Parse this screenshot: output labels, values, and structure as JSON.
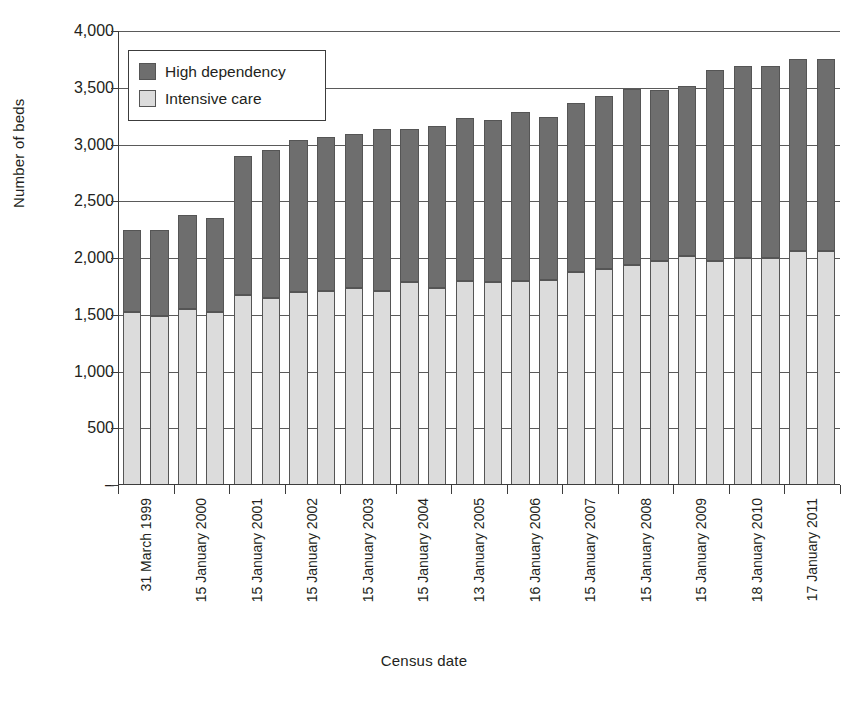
{
  "chart_data": {
    "type": "bar",
    "subtype": "stacked-vertical",
    "title": "",
    "xlabel": "Census date",
    "ylabel": "Number of beds",
    "ylim": [
      0,
      4000
    ],
    "yticks": [
      0,
      500,
      1000,
      1500,
      2000,
      2500,
      3000,
      3500,
      4000
    ],
    "ytick_labels": [
      "–",
      "500",
      "1,000",
      "1,500",
      "2,000",
      "2,500",
      "3,000",
      "3,500",
      "4,000"
    ],
    "grid": "horizontal",
    "legend_position": "upper-left-inside",
    "categories": [
      "31 March 1999",
      "31 March 1999",
      "15 January 2000",
      "15 January 2000",
      "15 January 2001",
      "15 January 2001",
      "15 January 2002",
      "15 January 2002",
      "15 January 2003",
      "15 January 2003",
      "15 January 2004",
      "15 January 2004",
      "13 January 2005",
      "13 January 2005",
      "16 January 2006",
      "16 January 2006",
      "15 January 2007",
      "15 January 2007",
      "15 January 2008",
      "15 January 2008",
      "15 January 2009",
      "15 January 2009",
      "18 January 2010",
      "18 January 2010",
      "17 January 2011",
      "17 January 2011"
    ],
    "xtick_labels": [
      "31 March 1999",
      "15 January 2000",
      "15 January 2001",
      "15 January 2002",
      "15 January 2003",
      "15 January 2004",
      "13 January 2005",
      "16 January 2006",
      "15 January 2007",
      "15 January 2008",
      "15 January 2009",
      "18 January 2010",
      "17 January 2011"
    ],
    "series": [
      {
        "name": "Intensive care",
        "color": "#dcdcdc",
        "values": [
          1520,
          1490,
          1555,
          1520,
          1670,
          1645,
          1700,
          1710,
          1735,
          1710,
          1785,
          1740,
          1795,
          1790,
          1795,
          1810,
          1875,
          1900,
          1940,
          1970,
          2020,
          1975,
          2000,
          2000,
          2060,
          2060
        ]
      },
      {
        "name": "High dependency",
        "color": "#6e6e6e",
        "values": [
          725,
          755,
          820,
          830,
          1225,
          1310,
          1340,
          1355,
          1360,
          1430,
          1355,
          1425,
          1440,
          1430,
          1490,
          1435,
          1490,
          1530,
          1545,
          1510,
          1495,
          1680,
          1695,
          1690,
          1690,
          1690
        ]
      }
    ],
    "totals": [
      2245,
      2245,
      2375,
      2350,
      2895,
      2955,
      3040,
      3065,
      3095,
      3140,
      3140,
      3165,
      3235,
      3220,
      3285,
      3245,
      3365,
      3430,
      3485,
      3480,
      3515,
      3655,
      3695,
      3690,
      3690,
      3750
    ]
  },
  "legend": {
    "items": [
      {
        "label": "High dependency",
        "color": "#6e6e6e"
      },
      {
        "label": "Intensive care",
        "color": "#dcdcdc"
      }
    ]
  },
  "axes": {
    "y_title": "Number of beds",
    "x_title": "Census date"
  }
}
